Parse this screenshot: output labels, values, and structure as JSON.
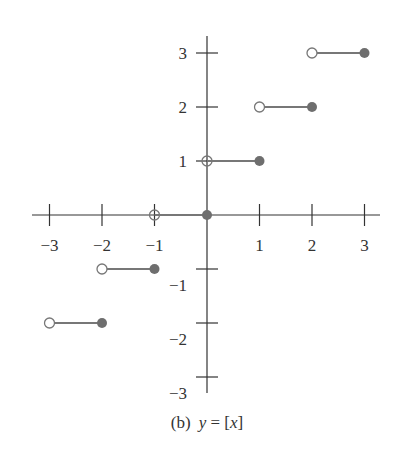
{
  "chart_data": {
    "type": "line",
    "title": "",
    "caption": {
      "label": "(b)",
      "equation_y": "y",
      "equation_eq": " = [",
      "equation_x": "x",
      "equation_close": "]"
    },
    "xlabel": "",
    "ylabel": "",
    "xlim": [
      -3.3,
      3.3
    ],
    "ylim": [
      -3.3,
      3.3
    ],
    "x_ticks": [
      -3,
      -2,
      -1,
      1,
      2,
      3
    ],
    "x_tick_labels": [
      "−3",
      "−2",
      "−1",
      "1",
      "2",
      "3"
    ],
    "y_ticks": [
      3,
      2,
      1,
      -1,
      -2,
      -3
    ],
    "y_tick_labels": [
      "3",
      "2",
      "1",
      "−1",
      "−2",
      "−3"
    ],
    "grid": false,
    "legend": "none",
    "series": [
      {
        "name": "floor step y=-2",
        "x_open": -3,
        "x_closed": -2,
        "y": -2
      },
      {
        "name": "floor step y=-1",
        "x_open": -2,
        "x_closed": -1,
        "y": -1
      },
      {
        "name": "floor step y=0",
        "x_open": -1,
        "x_closed": 0,
        "y": 0
      },
      {
        "name": "floor step y=1",
        "x_open": 0,
        "x_closed": 1,
        "y": 1
      },
      {
        "name": "floor step y=2",
        "x_open": 1,
        "x_closed": 2,
        "y": 2
      },
      {
        "name": "floor step y=3",
        "x_open": 2,
        "x_closed": 3,
        "y": 3
      }
    ],
    "colors": {
      "axis": "#333333",
      "segment": "#777777",
      "dot": "#6e6e6e"
    }
  }
}
